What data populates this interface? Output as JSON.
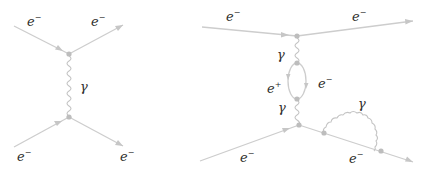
{
  "diagrams": [
    {
      "name": "electron-scattering-tree-level",
      "particles": {
        "incoming_top": {
          "label": "e",
          "charge": "−"
        },
        "outgoing_top": {
          "label": "e",
          "charge": "−"
        },
        "exchange": {
          "label": "γ"
        },
        "incoming_bottom": {
          "label": "e",
          "charge": "−"
        },
        "outgoing_bottom": {
          "label": "e",
          "charge": "−"
        }
      }
    },
    {
      "name": "electron-scattering-with-loop-and-emission",
      "particles": {
        "incoming_top": {
          "label": "e",
          "charge": "−"
        },
        "outgoing_top": {
          "label": "e",
          "charge": "−"
        },
        "photon_upper": {
          "label": "γ"
        },
        "loop_positron": {
          "label": "e",
          "charge": "+"
        },
        "loop_electron": {
          "label": "e",
          "charge": "−"
        },
        "photon_lower": {
          "label": "γ"
        },
        "emitted_photon": {
          "label": "γ"
        },
        "incoming_bottom": {
          "label": "e",
          "charge": "−"
        },
        "outgoing_bottom": {
          "label": "e",
          "charge": "−"
        }
      }
    }
  ],
  "colors": {
    "line": "#cdcdcd",
    "vertex": "#bdbdbd",
    "text": "#2e2e2e",
    "background": "#ffffff"
  }
}
